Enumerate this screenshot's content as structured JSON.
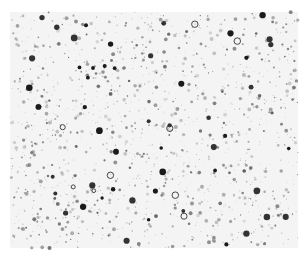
{
  "image": {
    "description": "Grayscale micrograph-like speckle texture: many small dark dots and circles scattered on a white/light gray background",
    "width": 305,
    "height": 258,
    "background": "#ffffff",
    "field": {
      "x": 10,
      "y": 12,
      "width": 288,
      "height": 236,
      "tint": "#f4f4f4"
    },
    "dot_colors": [
      "#1a1a1a",
      "#333333",
      "#555555",
      "#777777",
      "#999999",
      "#bbbbbb"
    ],
    "dot_count": 1400,
    "large_dot_count": 60,
    "seed": 7
  }
}
